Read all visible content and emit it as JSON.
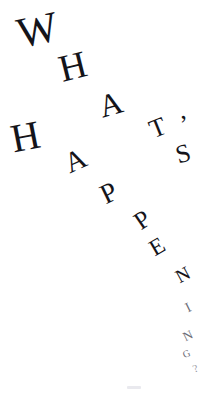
{
  "artwork": {
    "kind": "typographic-title",
    "full_text": "WHAT'S HAPPENING?",
    "line_1": "WHAT'S",
    "line_2": "HAPPENING?",
    "background_color": "#ffffff",
    "ink_color": "#14141a",
    "canvas": {
      "width": 217,
      "height": 393
    }
  },
  "glyphs": [
    {
      "char": "W",
      "x": 17,
      "y": 8,
      "size": 43,
      "rotate": -12,
      "weight": 400,
      "tone": "normal"
    },
    {
      "char": "H",
      "x": 59,
      "y": 47,
      "size": 38,
      "rotate": -14,
      "weight": 400,
      "tone": "normal"
    },
    {
      "char": "A",
      "x": 99,
      "y": 88,
      "size": 32,
      "rotate": -16,
      "weight": 400,
      "tone": "normal"
    },
    {
      "char": "T",
      "x": 150,
      "y": 115,
      "size": 26,
      "rotate": -22,
      "weight": 400,
      "tone": "normal"
    },
    {
      "char": "’",
      "x": 180,
      "y": 112,
      "size": 26,
      "rotate": -8,
      "weight": 400,
      "tone": "normal"
    },
    {
      "char": "S",
      "x": 176,
      "y": 141,
      "size": 26,
      "rotate": -16,
      "weight": 400,
      "tone": "normal"
    },
    {
      "char": "H",
      "x": 11,
      "y": 117,
      "size": 40,
      "rotate": -11,
      "weight": 400,
      "tone": "normal"
    },
    {
      "char": "A",
      "x": 65,
      "y": 146,
      "size": 29,
      "rotate": -24,
      "weight": 400,
      "tone": "normal"
    },
    {
      "char": "P",
      "x": 101,
      "y": 179,
      "size": 28,
      "rotate": -26,
      "weight": 400,
      "tone": "normal"
    },
    {
      "char": "P",
      "x": 135,
      "y": 207,
      "size": 25,
      "rotate": -34,
      "weight": 400,
      "tone": "normal"
    },
    {
      "char": "E",
      "x": 150,
      "y": 235,
      "size": 23,
      "rotate": -30,
      "weight": 400,
      "tone": "normal"
    },
    {
      "char": "N",
      "x": 176,
      "y": 265,
      "size": 19,
      "rotate": -28,
      "weight": 400,
      "tone": "normal"
    },
    {
      "char": "I",
      "x": 186,
      "y": 301,
      "size": 14,
      "rotate": -26,
      "weight": 400,
      "tone": "faint"
    },
    {
      "char": "N",
      "x": 183,
      "y": 329,
      "size": 13,
      "rotate": -26,
      "weight": 400,
      "tone": "faint"
    },
    {
      "char": "G",
      "x": 183,
      "y": 349,
      "size": 10,
      "rotate": -24,
      "weight": 400,
      "tone": "faint"
    },
    {
      "char": "?",
      "x": 193,
      "y": 363,
      "size": 11,
      "rotate": -22,
      "weight": 400,
      "tone": "veryfaint"
    }
  ],
  "marks": [
    {
      "name": "bottom-smudge",
      "x": 127,
      "y": 386,
      "width": 14,
      "height": 3
    }
  ]
}
